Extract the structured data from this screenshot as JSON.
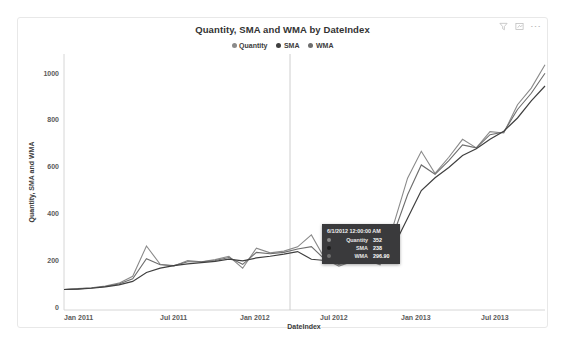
{
  "visual": {
    "title": "Quantity, SMA and WMA by DateIndex",
    "actions": [
      {
        "name": "filter-icon",
        "label": "Filters"
      },
      {
        "name": "focus-mode-icon",
        "label": "Focus mode"
      },
      {
        "name": "more-options-icon",
        "label": "More options"
      }
    ]
  },
  "legend": {
    "items": [
      {
        "label": "Quantity",
        "color": "#8a8a8a"
      },
      {
        "label": "SMA",
        "color": "#3f3f3f"
      },
      {
        "label": "WMA",
        "color": "#6e6e6e"
      }
    ]
  },
  "tooltip": {
    "header": "6/1/2012 12:00:00 AM",
    "rows": [
      {
        "name": "Quantity",
        "value": "352",
        "color": "#8a8a8a"
      },
      {
        "name": "SMA",
        "value": "238",
        "color": "#3f3f3f"
      },
      {
        "name": "WMA",
        "value": "296.90",
        "color": "#6e6e6e"
      }
    ]
  },
  "chart_data": {
    "type": "line",
    "title": "Quantity, SMA and WMA by DateIndex",
    "xlabel": "DateIndex",
    "ylabel": "Quantity, SMA and WMA",
    "grid": false,
    "legend_position": "top",
    "ylim": [
      0,
      1200
    ],
    "yticks": [
      0,
      200,
      400,
      600,
      800,
      1000
    ],
    "ytick_labels": [
      "0",
      "200",
      "400",
      "600",
      "800",
      "1000"
    ],
    "xticks": [
      "Jan 2011",
      "Jul 2011",
      "Jan 2012",
      "Jul 2012",
      "Jan 2013",
      "Jul 2013"
    ],
    "x": [
      "Jan 2011",
      "Feb 2011",
      "Mar 2011",
      "Apr 2011",
      "May 2011",
      "Jun 2011",
      "Jul 2011",
      "Aug 2011",
      "Sep 2011",
      "Oct 2011",
      "Nov 2011",
      "Dec 2011",
      "Jan 2012",
      "Feb 2012",
      "Mar 2012",
      "Apr 2012",
      "May 2012",
      "Jun 2012",
      "Jul 2012",
      "Aug 2012",
      "Sep 2012",
      "Oct 2012",
      "Nov 2012",
      "Dec 2012",
      "Jan 2013",
      "Feb 2013",
      "Mar 2013",
      "Apr 2013",
      "May 2013",
      "Jun 2013",
      "Jul 2013",
      "Aug 2013",
      "Sep 2013",
      "Oct 2013",
      "Nov 2013",
      "Dec 2013"
    ],
    "series": [
      {
        "name": "Quantity",
        "color": "#8a8a8a",
        "values": [
          96,
          100,
          104,
          112,
          126,
          158,
          300,
          214,
          206,
          232,
          226,
          236,
          252,
          196,
          290,
          268,
          276,
          296,
          352,
          238,
          206,
          228,
          234,
          212,
          404,
          618,
          744,
          640,
          716,
          800,
          760,
          836,
          830,
          962,
          1040,
          1150
        ]
      },
      {
        "name": "SMA",
        "color": "#3f3f3f",
        "values": [
          96,
          98,
          102,
          108,
          118,
          134,
          176,
          196,
          208,
          216,
          222,
          228,
          238,
          230,
          244,
          252,
          262,
          274,
          238,
          232,
          226,
          226,
          230,
          234,
          300,
          430,
          560,
          620,
          668,
          724,
          756,
          800,
          838,
          900,
          980,
          1050
        ]
      },
      {
        "name": "WMA",
        "color": "#6e6e6e",
        "values": [
          96,
          99,
          103,
          110,
          122,
          146,
          240,
          212,
          208,
          226,
          226,
          232,
          246,
          214,
          270,
          264,
          270,
          286,
          296.9,
          236,
          214,
          226,
          232,
          222,
          360,
          540,
          680,
          636,
          700,
          774,
          760,
          822,
          834,
          940,
          1016,
          1110
        ]
      }
    ],
    "hovered_point": {
      "x": "Jun 2012",
      "label": "6/1/2012 12:00:00 AM",
      "Quantity": 352,
      "SMA": 238,
      "WMA": 296.9
    }
  }
}
